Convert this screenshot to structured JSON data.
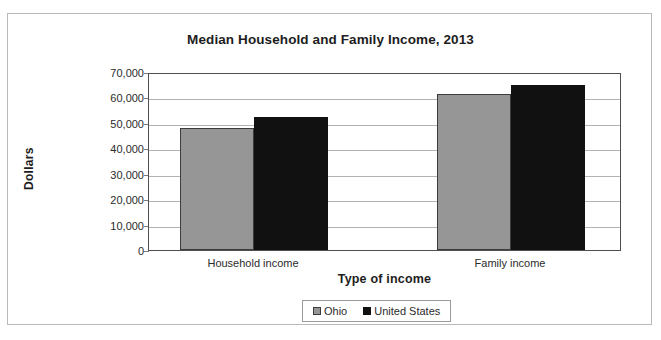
{
  "chart_data": {
    "type": "bar",
    "title": "Median Household and Family Income, 2013",
    "xlabel": "Type of income",
    "ylabel": "Dollars",
    "categories": [
      "Household income",
      "Family income"
    ],
    "series": [
      {
        "name": "Ohio",
        "color": "#969696",
        "values": [
          48000,
          61400
        ]
      },
      {
        "name": "United States",
        "color": "#111111",
        "values": [
          52500,
          65000
        ]
      }
    ],
    "ylim": [
      0,
      70000
    ],
    "ytick_values": [
      0,
      10000,
      20000,
      30000,
      40000,
      50000,
      60000,
      70000
    ],
    "ytick_labels": [
      "0",
      "10,000",
      "20,000",
      "30,000",
      "40,000",
      "50,000",
      "60,000",
      "70,000"
    ],
    "grid": true,
    "legend_position": "bottom",
    "legend": [
      "Ohio",
      "United States"
    ]
  }
}
